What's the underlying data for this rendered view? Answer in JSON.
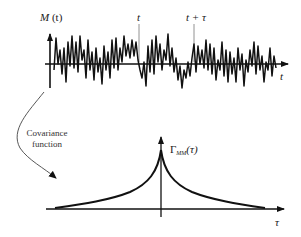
{
  "signal_plot": {
    "y_label_main": "M",
    "y_label_arg": "(t)",
    "x_axis_label": "t",
    "marker_t_label": "t",
    "marker_t_tau_label": "t + τ"
  },
  "transition": {
    "caption_line1": "Covariance",
    "caption_line2": "function"
  },
  "covariance_plot": {
    "y_label_main": "Γ",
    "y_label_sub": "MM",
    "y_label_arg": "(τ)",
    "x_axis_label": "τ"
  },
  "colors": {
    "ink": "#111111",
    "thin_line": "#777777",
    "background": "#ffffff"
  }
}
